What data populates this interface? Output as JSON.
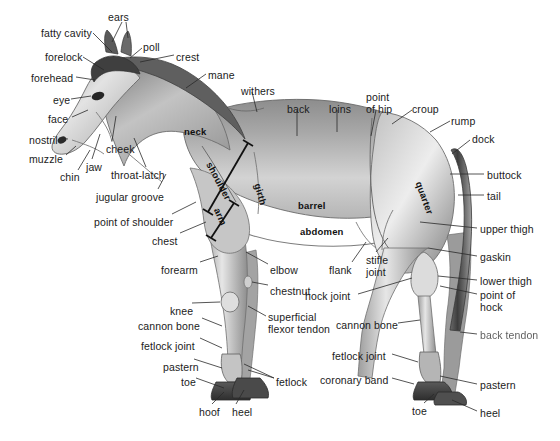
{
  "figure": {
    "background_color": "#ffffff",
    "ink_color": "#1b1b1b",
    "leader_line_color": "#2a2a2a"
  },
  "labels_left": [
    {
      "id": "fatty-cavity",
      "text": "fatty cavity",
      "x": 41,
      "y": 28,
      "align": "left"
    },
    {
      "id": "ears",
      "text": "ears",
      "x": 108,
      "y": 12,
      "align": "left"
    },
    {
      "id": "forelock",
      "text": "forelock",
      "x": 45,
      "y": 52,
      "align": "left"
    },
    {
      "id": "poll",
      "text": "poll",
      "x": 143,
      "y": 42,
      "align": "left"
    },
    {
      "id": "crest",
      "text": "crest",
      "x": 176,
      "y": 52,
      "align": "left"
    },
    {
      "id": "forehead",
      "text": "forehead",
      "x": 31,
      "y": 73,
      "align": "left"
    },
    {
      "id": "mane",
      "text": "mane",
      "x": 208,
      "y": 70,
      "align": "left"
    },
    {
      "id": "eye",
      "text": "eye",
      "x": 53,
      "y": 95,
      "align": "left"
    },
    {
      "id": "face",
      "text": "face",
      "x": 48,
      "y": 114,
      "align": "left"
    },
    {
      "id": "nostril",
      "text": "nostril",
      "x": 29,
      "y": 135,
      "align": "left"
    },
    {
      "id": "muzzle",
      "text": "muzzle",
      "x": 29,
      "y": 154,
      "align": "left"
    },
    {
      "id": "cheek",
      "text": "cheek",
      "x": 106,
      "y": 144,
      "align": "left"
    },
    {
      "id": "jaw",
      "text": "jaw",
      "x": 86,
      "y": 162,
      "align": "left"
    },
    {
      "id": "chin",
      "text": "chin",
      "x": 60,
      "y": 172,
      "align": "left"
    },
    {
      "id": "throat-latch",
      "text": "throat-latch",
      "x": 111,
      "y": 170,
      "align": "left"
    },
    {
      "id": "jugular-groove",
      "text": "jugular groove",
      "x": 96,
      "y": 192,
      "align": "left"
    },
    {
      "id": "point-of-shoulder",
      "text": "point of shoulder",
      "x": 94,
      "y": 217,
      "align": "left"
    },
    {
      "id": "chest",
      "text": "chest",
      "x": 152,
      "y": 236,
      "align": "left"
    },
    {
      "id": "forearm",
      "text": "forearm",
      "x": 161,
      "y": 265,
      "align": "left"
    },
    {
      "id": "knee",
      "text": "knee",
      "x": 170,
      "y": 306,
      "align": "left"
    },
    {
      "id": "cannon-bone-front",
      "text": "cannon bone",
      "x": 138,
      "y": 321,
      "align": "left"
    },
    {
      "id": "fetlock-joint-front",
      "text": "fetlock joint",
      "x": 141,
      "y": 341,
      "align": "left"
    },
    {
      "id": "pastern-front",
      "text": "pastern",
      "x": 163,
      "y": 362,
      "align": "left"
    },
    {
      "id": "toe-front",
      "text": "toe",
      "x": 181,
      "y": 377,
      "align": "left"
    },
    {
      "id": "hoof",
      "text": "hoof",
      "x": 199,
      "y": 407,
      "align": "left"
    },
    {
      "id": "heel-front",
      "text": "heel",
      "x": 232,
      "y": 407,
      "align": "left"
    },
    {
      "id": "withers",
      "text": "withers",
      "x": 241,
      "y": 86,
      "align": "left"
    },
    {
      "id": "elbow",
      "text": "elbow",
      "x": 270,
      "y": 265,
      "align": "left"
    },
    {
      "id": "chestnut",
      "text": "chestnut",
      "x": 270,
      "y": 286,
      "align": "left"
    },
    {
      "id": "superficial-flexor-tendon",
      "text": "superficial\nflexor tendon",
      "x": 268,
      "y": 312,
      "align": "left"
    },
    {
      "id": "fetlock",
      "text": "fetlock",
      "x": 276,
      "y": 377,
      "align": "left"
    }
  ],
  "labels_top": [
    {
      "id": "back",
      "text": "back",
      "x": 287,
      "y": 104,
      "align": "left"
    },
    {
      "id": "loins",
      "text": "loins",
      "x": 329,
      "y": 104,
      "align": "left"
    },
    {
      "id": "point-of-hip",
      "text": "point\nof hip",
      "x": 366,
      "y": 92,
      "align": "left"
    },
    {
      "id": "croup",
      "text": "croup",
      "x": 412,
      "y": 104,
      "align": "left"
    },
    {
      "id": "rump",
      "text": "rump",
      "x": 451,
      "y": 116,
      "align": "left"
    },
    {
      "id": "dock",
      "text": "dock",
      "x": 472,
      "y": 134,
      "align": "left"
    }
  ],
  "labels_right": [
    {
      "id": "buttock",
      "text": "buttock",
      "x": 487,
      "y": 170,
      "align": "left"
    },
    {
      "id": "tail",
      "text": "tail",
      "x": 487,
      "y": 191,
      "align": "left"
    },
    {
      "id": "upper-thigh",
      "text": "upper thigh",
      "x": 480,
      "y": 224,
      "align": "left"
    },
    {
      "id": "gaskin",
      "text": "gaskin",
      "x": 480,
      "y": 252,
      "align": "left"
    },
    {
      "id": "lower-thigh",
      "text": "lower thigh",
      "x": 480,
      "y": 276,
      "align": "left"
    },
    {
      "id": "point-of-hock",
      "text": "point of\nhock",
      "x": 480,
      "y": 290,
      "align": "left"
    },
    {
      "id": "back-tendon",
      "text": "back tendon",
      "x": 480,
      "y": 330,
      "align": "left",
      "blurred": true
    },
    {
      "id": "pastern-hind",
      "text": "pastern",
      "x": 480,
      "y": 380,
      "align": "left"
    },
    {
      "id": "heel-hind",
      "text": "heel",
      "x": 480,
      "y": 408,
      "align": "left"
    }
  ],
  "labels_hind": [
    {
      "id": "flank",
      "text": "flank",
      "x": 329,
      "y": 265,
      "align": "left"
    },
    {
      "id": "stifle-joint",
      "text": "stifle\njoint",
      "x": 366,
      "y": 255,
      "align": "left"
    },
    {
      "id": "hock-joint",
      "text": "hock joint",
      "x": 305,
      "y": 291,
      "align": "left"
    },
    {
      "id": "cannon-bone-hind",
      "text": "cannon bone",
      "x": 336,
      "y": 320,
      "align": "left"
    },
    {
      "id": "fetlock-joint-hind",
      "text": "fetlock joint",
      "x": 332,
      "y": 351,
      "align": "left"
    },
    {
      "id": "coronary-band",
      "text": "coronary band",
      "x": 320,
      "y": 375,
      "align": "left"
    },
    {
      "id": "toe-hind",
      "text": "toe",
      "x": 412,
      "y": 406,
      "align": "left"
    }
  ],
  "labels_inner": [
    {
      "id": "neck",
      "text": "neck",
      "x": 184,
      "y": 126,
      "rotation": 0,
      "bold": true
    },
    {
      "id": "shoulder",
      "text": "shoulder",
      "x": 214,
      "y": 160,
      "rotation": 62,
      "bold": true
    },
    {
      "id": "arm",
      "text": "arm",
      "x": 222,
      "y": 206,
      "rotation": 66,
      "bold": true
    },
    {
      "id": "girth",
      "text": "girth",
      "x": 263,
      "y": 182,
      "rotation": 74,
      "bold": true
    },
    {
      "id": "barrel",
      "text": "barrel",
      "x": 298,
      "y": 200,
      "rotation": 0,
      "bold": true
    },
    {
      "id": "abdomen",
      "text": "abdomen",
      "x": 300,
      "y": 226,
      "rotation": 0,
      "bold": true
    },
    {
      "id": "quarter",
      "text": "quarter",
      "x": 424,
      "y": 180,
      "rotation": 70,
      "bold": true
    }
  ],
  "measure_bars": [
    {
      "id": "shoulder-bar",
      "x1": 208,
      "y1": 212,
      "x2": 248,
      "y2": 143
    },
    {
      "id": "arm-bar",
      "x1": 211,
      "y1": 238,
      "x2": 234,
      "y2": 203
    }
  ]
}
